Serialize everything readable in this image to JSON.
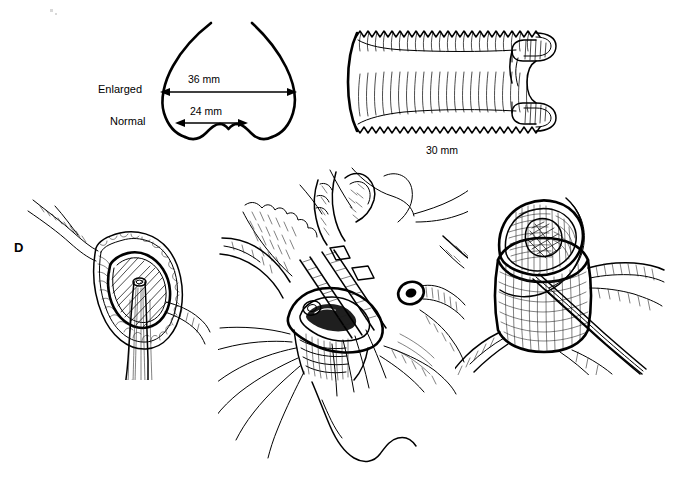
{
  "figure": {
    "panel_letter": "D",
    "width": 679,
    "height": 484,
    "background_color": "#ffffff",
    "ink_color": "#000000",
    "style": "pen-and-ink surgical line drawing"
  },
  "aortic_root_diagram": {
    "title_implied": "Aortic root sinus diameter comparison",
    "enlarged_label": "Enlarged",
    "normal_label": "Normal",
    "enlarged_measure": "36 mm",
    "normal_measure": "24 mm"
  },
  "graft_diagram": {
    "measure": "30 mm",
    "description": "corrugated woven vascular graft with folded-back cuff",
    "corrugation_count": 38
  },
  "surgical_panels": [
    {
      "name": "aortic-annulus-exposure",
      "caption": ""
    },
    {
      "name": "graft-suture-placement",
      "caption": ""
    },
    {
      "name": "graft-insertion-forceps",
      "caption": ""
    }
  ]
}
